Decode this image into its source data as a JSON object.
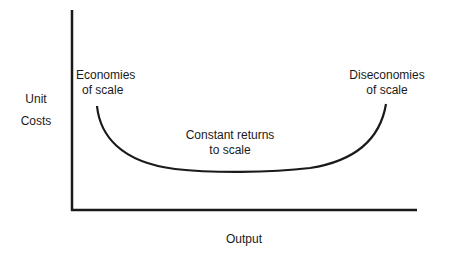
{
  "diagram": {
    "y_axis_label": [
      "Unit",
      "Costs"
    ],
    "x_axis_label": "Output",
    "annotations": {
      "left": [
        "Economies",
        "of scale"
      ],
      "center": [
        "Constant returns",
        "to scale"
      ],
      "right": [
        "Diseconomies",
        "of scale"
      ]
    },
    "colors": {
      "stroke": "#1a1a1a",
      "background": "#ffffff"
    }
  }
}
